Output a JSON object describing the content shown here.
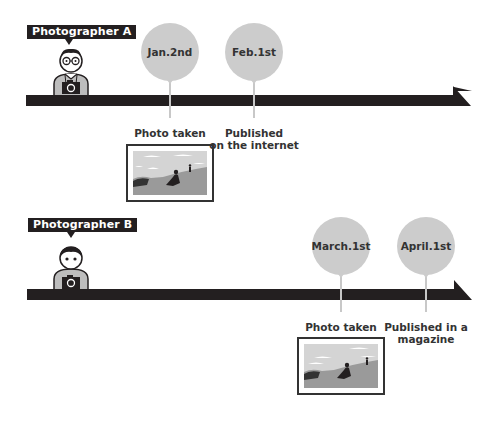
{
  "photographers": [
    {
      "tag": "Photographer A",
      "style": "glasses",
      "events": [
        {
          "date": "Jan.2nd",
          "label_line1": "Photo taken",
          "label_line2": "",
          "has_photo": true
        },
        {
          "date": "Feb.1st",
          "label_line1": "Published",
          "label_line2": "on the internet",
          "has_photo": false
        }
      ]
    },
    {
      "tag": "Photographer B",
      "style": "plain",
      "events": [
        {
          "date": "March.1st",
          "label_line1": "Photo taken",
          "label_line2": "",
          "has_photo": true
        },
        {
          "date": "April.1st",
          "label_line1": "Published in a",
          "label_line2": "magazine",
          "has_photo": false
        }
      ]
    }
  ],
  "colors": {
    "bar": "#231f20",
    "bubble": "#cccccc",
    "stem": "#c8c8c8",
    "text": "#333333",
    "shirt": "#bdbdbd"
  },
  "icons": {
    "camera": "camera-icon",
    "person": "person-icon",
    "photo": "landscape-photo-icon"
  }
}
